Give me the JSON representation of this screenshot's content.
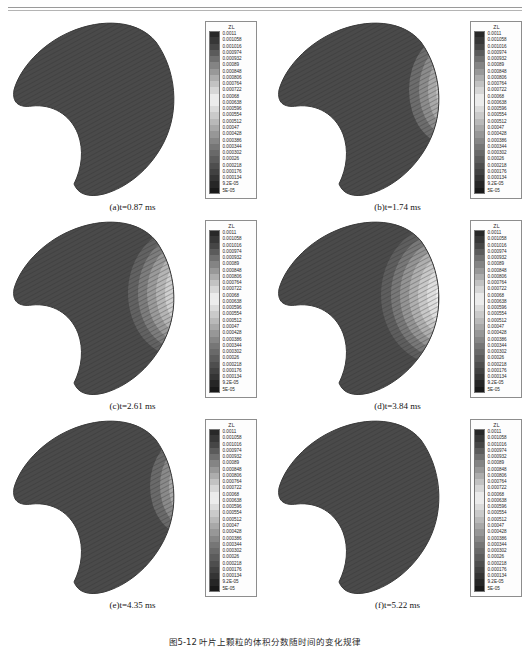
{
  "figure": {
    "caption": "图5-12 叶片上颗粒的体积分数随时间的变化规律",
    "legend": {
      "title": "ZL",
      "ticks": [
        "0.0011",
        "0.001058",
        "0.001016",
        "0.000974",
        "0.000932",
        "0.00089",
        "0.000848",
        "0.000806",
        "0.000764",
        "0.000722",
        "0.00068",
        "0.000638",
        "0.000596",
        "0.000554",
        "0.000512",
        "0.00047",
        "0.000428",
        "0.000386",
        "0.000344",
        "0.000302",
        "0.00026",
        "0.000218",
        "0.000176",
        "0.000134",
        "9.2E-05",
        "5E-05"
      ]
    },
    "panels": [
      {
        "id": "a",
        "caption": "(a)t=0.87 ms",
        "label": "(a)",
        "time": "t=0.87 ms",
        "contour_extent": 0.0
      },
      {
        "id": "b",
        "caption": "(b)t=1.74 ms",
        "label": "(b)",
        "time": "t=1.74 ms",
        "contour_extent": 0.55
      },
      {
        "id": "c",
        "caption": "(c)t=2.61 ms",
        "label": "(c)",
        "time": "t=2.61 ms",
        "contour_extent": 0.8
      },
      {
        "id": "d",
        "caption": "(d)t=3.84 ms",
        "label": "(d)",
        "time": "t=3.84 ms",
        "contour_extent": 1.0
      },
      {
        "id": "e",
        "caption": "(e)t=4.35 ms",
        "label": "(e)",
        "time": "t=4.35 ms",
        "contour_extent": 0.45
      },
      {
        "id": "f",
        "caption": "(f)t=5.22 ms",
        "label": "(f)",
        "time": "t=5.22 ms",
        "contour_extent": 0.12
      }
    ]
  },
  "chart_data": {
    "type": "heatmap",
    "title": "图5-12 叶片上颗粒的体积分数随时间的变化规律",
    "variable": "ZL",
    "quantity_label": "ZL",
    "colormap": "grayscale",
    "n_levels": 26,
    "level_step": 4.2e-05,
    "zlim": [
      5e-05,
      0.0011
    ],
    "levels": [
      0.0011,
      0.001058,
      0.001016,
      0.000974,
      0.000932,
      0.00089,
      0.000848,
      0.000806,
      0.000764,
      0.000722,
      0.00068,
      0.000638,
      0.000596,
      0.000554,
      0.000512,
      0.00047,
      0.000428,
      0.000386,
      0.000344,
      0.000302,
      0.00026,
      0.000218,
      0.000176,
      0.000134,
      9.2e-05,
      5e-05
    ],
    "panel_times_ms": [
      0.87,
      1.74,
      2.61,
      3.84,
      4.35,
      5.22
    ],
    "panel_labels": [
      "(a)",
      "(b)",
      "(c)",
      "(d)",
      "(e)",
      "(f)"
    ],
    "series": [
      {
        "name": "(a)t=0.87 ms",
        "time_ms": 0.87,
        "field_min": 5e-05,
        "field_max": 0.0011,
        "high_value_band_fraction": 0.0
      },
      {
        "name": "(b)t=1.74 ms",
        "time_ms": 1.74,
        "field_min": 5e-05,
        "field_max": 0.0011,
        "high_value_band_fraction": 0.18
      },
      {
        "name": "(c)t=2.61 ms",
        "time_ms": 2.61,
        "field_min": 5e-05,
        "field_max": 0.0011,
        "high_value_band_fraction": 0.26
      },
      {
        "name": "(d)t=3.84 ms",
        "time_ms": 3.84,
        "field_min": 5e-05,
        "field_max": 0.0011,
        "high_value_band_fraction": 0.33
      },
      {
        "name": "(e)t=4.35 ms",
        "time_ms": 4.35,
        "field_min": 5e-05,
        "field_max": 0.0011,
        "high_value_band_fraction": 0.14
      },
      {
        "name": "(f)t=5.22 ms",
        "time_ms": 5.22,
        "field_min": 5e-05,
        "field_max": 0.0011,
        "high_value_band_fraction": 0.04
      }
    ],
    "legend_position": "right-of-each-panel",
    "grid": false
  }
}
